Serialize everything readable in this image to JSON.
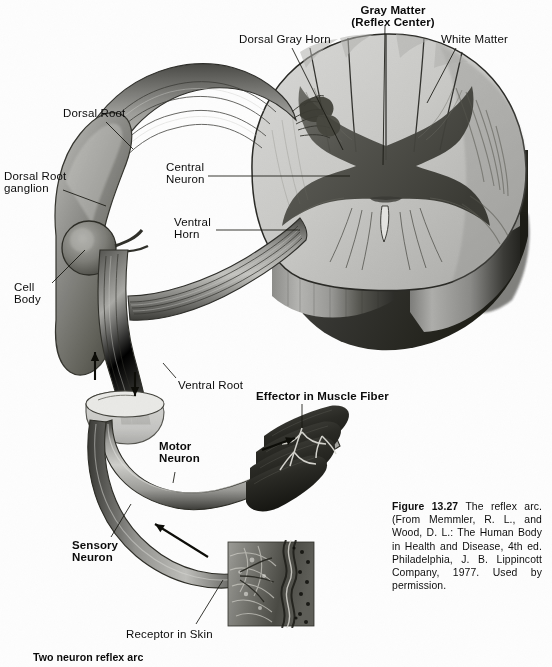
{
  "figure": {
    "domain": "scanned textbook figure",
    "background_color": "#fdfdfd",
    "ink_color": "#0b0b0b"
  },
  "labels": [
    {
      "id": "gray-matter",
      "text": "Gray Matter\n(Reflex Center)",
      "bold": true,
      "x": 333,
      "y": 4,
      "align": "center",
      "w": 120
    },
    {
      "id": "dorsal-gray-horn",
      "text": "Dorsal Gray Horn",
      "bold": false,
      "x": 239,
      "y": 33,
      "align": "left",
      "w": 110
    },
    {
      "id": "white-matter",
      "text": "White Matter",
      "bold": false,
      "x": 441,
      "y": 33,
      "align": "left",
      "w": 90
    },
    {
      "id": "dorsal-root",
      "text": "Dorsal Root",
      "bold": false,
      "x": 63,
      "y": 107,
      "align": "left",
      "w": 84
    },
    {
      "id": "central-neuron",
      "text": "Central\nNeuron",
      "bold": false,
      "x": 166,
      "y": 161,
      "align": "left",
      "w": 60
    },
    {
      "id": "dorsal-root-ganglion",
      "text": "Dorsal Root\nganglion",
      "bold": false,
      "x": 4,
      "y": 170,
      "align": "left",
      "w": 82
    },
    {
      "id": "ventral-horn",
      "text": "Ventral\nHorn",
      "bold": false,
      "x": 174,
      "y": 216,
      "align": "left",
      "w": 58
    },
    {
      "id": "cell-body",
      "text": "Cell\nBody",
      "bold": false,
      "x": 14,
      "y": 281,
      "align": "left",
      "w": 44
    },
    {
      "id": "ventral-root",
      "text": "Ventral Root",
      "bold": false,
      "x": 178,
      "y": 379,
      "align": "left",
      "w": 86
    },
    {
      "id": "effector-muscle",
      "text": "Effector in Muscle Fiber",
      "bold": true,
      "x": 256,
      "y": 390,
      "align": "left",
      "w": 150
    },
    {
      "id": "motor-neuron",
      "text": "Motor\nNeuron",
      "bold": true,
      "x": 159,
      "y": 440,
      "align": "left",
      "w": 52
    },
    {
      "id": "sensory-neuron",
      "text": "Sensory\nNeuron",
      "bold": true,
      "x": 72,
      "y": 539,
      "align": "left",
      "w": 56
    },
    {
      "id": "receptor-in-skin",
      "text": "Receptor in Skin",
      "bold": false,
      "x": 126,
      "y": 628,
      "align": "left",
      "w": 110
    }
  ],
  "caption": {
    "figure_word": "Figure",
    "figure_number": "13.27",
    "body": "The reflex arc. (From Memmler, R. L., and Wood, D. L.: The Human Body in Health and Disease, 4th ed. Philadelphia, J. B. Lippincott Company, 1977. Used by permission.",
    "x": 392,
    "y": 500,
    "width": 150
  },
  "footer": {
    "text": "Two neuron reflex arc",
    "x": 33,
    "y": 651
  },
  "leader_lines": [
    {
      "id": "leader-gray-matter",
      "x1": 385,
      "y1": 26,
      "x2": 383,
      "y2": 165
    },
    {
      "id": "leader-dorsal-gray-horn",
      "x1": 292,
      "y1": 48,
      "x2": 343,
      "y2": 150
    },
    {
      "id": "leader-white-matter",
      "x1": 456,
      "y1": 48,
      "x2": 427,
      "y2": 103
    },
    {
      "id": "leader-dorsal-root",
      "x1": 106,
      "y1": 122,
      "x2": 133,
      "y2": 149
    },
    {
      "id": "leader-central-neuron",
      "x1": 208,
      "y1": 176,
      "x2": 350,
      "y2": 176
    },
    {
      "id": "leader-drg",
      "x1": 63,
      "y1": 190,
      "x2": 106,
      "y2": 206
    },
    {
      "id": "leader-ventral-horn",
      "x1": 216,
      "y1": 230,
      "x2": 300,
      "y2": 230
    },
    {
      "id": "leader-cell-body",
      "x1": 52,
      "y1": 283,
      "x2": 85,
      "y2": 250
    },
    {
      "id": "leader-ventral-root",
      "x1": 176,
      "y1": 378,
      "x2": 163,
      "y2": 363
    },
    {
      "id": "leader-effector",
      "x1": 302,
      "y1": 404,
      "x2": 302,
      "y2": 428
    },
    {
      "id": "leader-motor-neuron",
      "x1": 175,
      "y1": 472,
      "x2": 173,
      "y2": 483
    },
    {
      "id": "leader-sensory-neuron",
      "x1": 111,
      "y1": 537,
      "x2": 131,
      "y2": 504
    },
    {
      "id": "leader-receptor",
      "x1": 196,
      "y1": 624,
      "x2": 223,
      "y2": 580
    }
  ],
  "flow_arrows": [
    {
      "id": "arrow-dorsal-root-up",
      "x1": 95,
      "y1": 380,
      "x2": 95,
      "y2": 352
    },
    {
      "id": "arrow-ventral-root-dn",
      "x1": 135,
      "y1": 372,
      "x2": 135,
      "y2": 396
    },
    {
      "id": "arrow-motor-out",
      "x1": 262,
      "y1": 450,
      "x2": 295,
      "y2": 438
    },
    {
      "id": "arrow-sensory-in",
      "x1": 208,
      "y1": 557,
      "x2": 155,
      "y2": 524
    }
  ]
}
